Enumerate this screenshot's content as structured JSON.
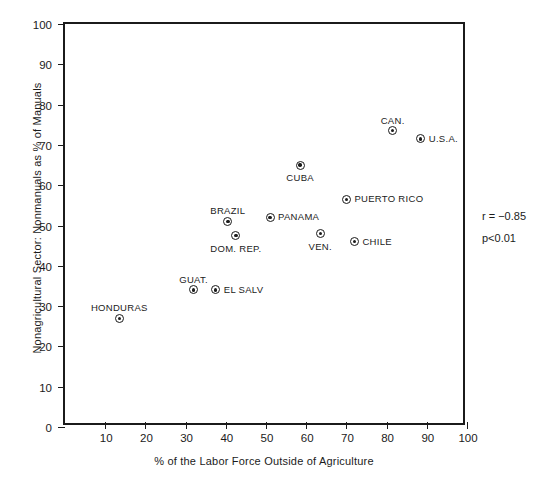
{
  "chart_data": {
    "type": "scatter",
    "title": "",
    "xlabel": "% of the Labor Force Outside of Agriculture",
    "ylabel": "Nonagricultural Sector: Nonmanuals as % of Manuals",
    "xlim": [
      0,
      100
    ],
    "ylim": [
      0,
      100
    ],
    "xticks": [
      10,
      20,
      30,
      40,
      50,
      60,
      70,
      80,
      90,
      100
    ],
    "yticks": [
      0,
      10,
      20,
      30,
      40,
      50,
      60,
      70,
      80,
      90,
      100
    ],
    "grid": false,
    "legend": "none",
    "points": [
      {
        "label": "HONDURAS",
        "x": 13.5,
        "y": 27.0,
        "label_pos": "above"
      },
      {
        "label": "GUAT.",
        "x": 32.0,
        "y": 34.0,
        "label_pos": "above"
      },
      {
        "label": "EL SALV",
        "x": 37.5,
        "y": 34.0,
        "label_pos": "right"
      },
      {
        "label": "BRAZIL",
        "x": 40.5,
        "y": 51.0,
        "label_pos": "above"
      },
      {
        "label": "DOM. REP.",
        "x": 42.5,
        "y": 47.5,
        "label_pos": "below"
      },
      {
        "label": "PANAMA",
        "x": 51.0,
        "y": 52.0,
        "label_pos": "right"
      },
      {
        "label": "CUBA",
        "x": 58.5,
        "y": 65.0,
        "label_pos": "below"
      },
      {
        "label": "VEN.",
        "x": 63.5,
        "y": 48.0,
        "label_pos": "below"
      },
      {
        "label": "PUERTO  RICO",
        "x": 70.0,
        "y": 56.5,
        "label_pos": "right"
      },
      {
        "label": "CHILE",
        "x": 72.0,
        "y": 46.0,
        "label_pos": "right"
      },
      {
        "label": "CAN.",
        "x": 81.5,
        "y": 73.5,
        "label_pos": "above"
      },
      {
        "label": "U.S.A.",
        "x": 88.5,
        "y": 71.5,
        "label_pos": "right"
      }
    ],
    "annotations": [
      {
        "name": "correlation",
        "text": "r = −0.85"
      },
      {
        "name": "significance",
        "text": "p<0.01"
      }
    ]
  },
  "caption": {
    "text": ""
  }
}
